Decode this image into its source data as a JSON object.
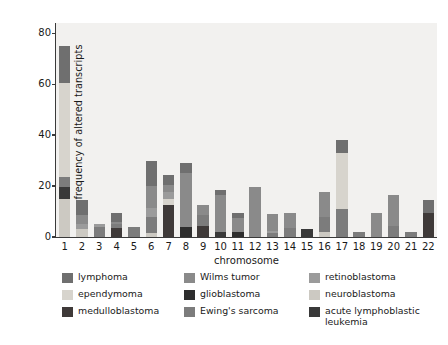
{
  "chart_data": {
    "type": "bar",
    "stacked": true,
    "title": "",
    "xlabel": "chromosome",
    "ylabel": "frequency of altered transcripts",
    "categories": [
      "1",
      "2",
      "3",
      "4",
      "5",
      "6",
      "7",
      "8",
      "9",
      "10",
      "11",
      "12",
      "13",
      "14",
      "15",
      "16",
      "17",
      "18",
      "19",
      "20",
      "21",
      "22"
    ],
    "yticks": [
      "0",
      "20",
      "40",
      "60",
      "80"
    ],
    "ytick_values": [
      0,
      20,
      40,
      60,
      80
    ],
    "ylim": [
      0,
      84
    ],
    "grid": false,
    "legend_position": "below",
    "plot_background": "#f2f1ef",
    "series": [
      {
        "name": "neuroblastoma",
        "color": "#ccc9c2",
        "values": [
          15.0,
          3.0,
          0.0,
          0.0,
          0.0,
          1.5,
          0.0,
          0.0,
          0.0,
          0.0,
          0.0,
          0.0,
          0.0,
          0.0,
          0.0,
          2.0,
          0.0,
          0.0,
          0.0,
          0.0,
          0.0,
          0.0
        ]
      },
      {
        "name": "acute lymphoblastic leukemia",
        "color": "#393939",
        "values": [
          4.5,
          0.0,
          0.0,
          0.0,
          0.0,
          0.0,
          0.0,
          0.0,
          0.0,
          2.0,
          0.0,
          0.0,
          0.0,
          0.0,
          3.0,
          0.0,
          0.0,
          0.0,
          0.0,
          0.0,
          0.0,
          0.0
        ]
      },
      {
        "name": "medulloblastoma",
        "color": "#3f3a39",
        "values": [
          0.0,
          0.0,
          0.0,
          3.5,
          0.0,
          0.0,
          12.5,
          0.0,
          4.5,
          0.0,
          0.0,
          0.0,
          0.0,
          0.0,
          0.0,
          0.0,
          0.0,
          0.0,
          0.0,
          0.0,
          0.0,
          9.5
        ]
      },
      {
        "name": "Ewing's sarcoma",
        "color": "#7c7c7c",
        "values": [
          4.0,
          0.0,
          4.0,
          1.5,
          4.0,
          6.5,
          0.0,
          0.0,
          4.0,
          0.0,
          0.0,
          0.0,
          1.5,
          3.5,
          0.0,
          6.0,
          11.0,
          2.0,
          0.0,
          4.5,
          2.0,
          0.0
        ]
      },
      {
        "name": "glioblastoma",
        "color": "#2e2e2e",
        "values": [
          0.0,
          0.0,
          0.0,
          0.0,
          0.0,
          0.0,
          0.0,
          4.0,
          0.0,
          0.0,
          2.0,
          0.0,
          0.0,
          0.0,
          0.0,
          0.0,
          0.0,
          0.0,
          0.0,
          0.0,
          0.0,
          0.0
        ]
      },
      {
        "name": "ependymoma",
        "color": "#d7d4cd",
        "values": [
          37.0,
          0.0,
          0.0,
          0.0,
          0.0,
          0.0,
          2.5,
          0.0,
          0.0,
          0.0,
          0.0,
          0.0,
          0.0,
          0.0,
          0.0,
          0.0,
          22.0,
          0.0,
          0.0,
          0.0,
          0.0,
          0.0
        ]
      },
      {
        "name": "retinoblastoma",
        "color": "#9b9b9b",
        "values": [
          0.0,
          2.0,
          1.0,
          0.0,
          0.0,
          3.5,
          2.5,
          0.0,
          0.0,
          0.0,
          0.0,
          0.0,
          1.0,
          0.0,
          0.0,
          0.0,
          0.0,
          0.0,
          0.0,
          0.0,
          0.0,
          0.0
        ]
      },
      {
        "name": "Wilms tumor",
        "color": "#8a8a8a",
        "values": [
          0.0,
          3.5,
          0.0,
          1.0,
          0.0,
          8.5,
          3.0,
          21.0,
          4.0,
          14.5,
          5.5,
          19.5,
          6.5,
          6.0,
          0.0,
          9.5,
          0.0,
          0.0,
          9.5,
          12.0,
          0.0,
          0.0
        ]
      },
      {
        "name": "lymphoma",
        "color": "#6f6f6f",
        "values": [
          14.5,
          6.0,
          0.0,
          3.5,
          0.0,
          10.0,
          4.0,
          4.0,
          0.0,
          2.0,
          2.0,
          0.0,
          0.0,
          0.0,
          0.0,
          0.0,
          5.0,
          0.0,
          0.0,
          0.0,
          0.0,
          5.0
        ]
      }
    ],
    "totals": [
      75.0,
      14.5,
      5.0,
      9.5,
      4.0,
      30.0,
      24.5,
      29.0,
      12.5,
      18.5,
      9.5,
      19.5,
      9.0,
      9.5,
      3.0,
      17.5,
      38.0,
      2.0,
      9.5,
      16.5,
      2.0,
      14.5
    ]
  },
  "legend": {
    "items": [
      {
        "label": "lymphoma",
        "color": "#6f6f6f",
        "icon": "color-swatch"
      },
      {
        "label": "Wilms tumor",
        "color": "#8a8a8a",
        "icon": "color-swatch"
      },
      {
        "label": "retinoblastoma",
        "color": "#9b9b9b",
        "icon": "color-swatch"
      },
      {
        "label": "ependymoma",
        "color": "#d7d4cd",
        "icon": "color-swatch"
      },
      {
        "label": "glioblastoma",
        "color": "#2e2e2e",
        "icon": "color-swatch"
      },
      {
        "label": "neuroblastoma",
        "color": "#ccc9c2",
        "icon": "color-swatch"
      },
      {
        "label": "medulloblastoma",
        "color": "#3f3a39",
        "icon": "color-swatch"
      },
      {
        "label": "Ewing's sarcoma",
        "color": "#7c7c7c",
        "icon": "color-swatch"
      },
      {
        "label": "acute lymphoblastic\nleukemia",
        "color": "#393939",
        "icon": "color-swatch"
      }
    ]
  }
}
